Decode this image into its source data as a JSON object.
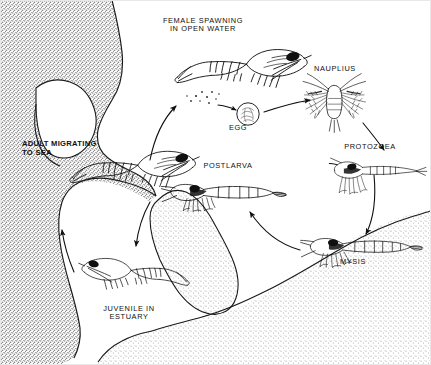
{
  "figure": {
    "labels": {
      "female_spawning": "FEMALE SPAWNING\nIN OPEN WATER",
      "nauplius": "NAUPLIUS",
      "protozoea": "PROTOZOEA",
      "mysis": "MYSIS",
      "postlarva": "POSTLARVA",
      "egg": "EGG",
      "adult_migrating": "ADULT MIGRATING\nTO SEA",
      "juvenile": "JUVENILE IN\nESTUARY"
    },
    "stages": [
      {
        "id": "female-spawning",
        "label": "FEMALE SPAWNING IN OPEN WATER",
        "kind": "adult-shrimp"
      },
      {
        "id": "egg",
        "label": "EGG",
        "kind": "egg"
      },
      {
        "id": "nauplius",
        "label": "NAUPLIUS",
        "kind": "nauplius-larva"
      },
      {
        "id": "protozoea",
        "label": "PROTOZOEA",
        "kind": "protozoea-larva"
      },
      {
        "id": "mysis",
        "label": "MYSIS",
        "kind": "mysis-larva"
      },
      {
        "id": "postlarva",
        "label": "POSTLARVA",
        "kind": "postlarva-shrimp"
      },
      {
        "id": "juvenile",
        "label": "JUVENILE IN ESTUARY",
        "kind": "juvenile-shrimp"
      },
      {
        "id": "adult-migrating",
        "label": "ADULT MIGRATING TO SEA",
        "kind": "adult-shrimp"
      }
    ],
    "flow": [
      {
        "from": "female-spawning",
        "to": "egg"
      },
      {
        "from": "egg",
        "to": "nauplius"
      },
      {
        "from": "nauplius",
        "to": "protozoea"
      },
      {
        "from": "protozoea",
        "to": "mysis"
      },
      {
        "from": "mysis",
        "to": "postlarva"
      },
      {
        "from": "postlarva",
        "to": "juvenile"
      },
      {
        "from": "juvenile",
        "to": "adult-migrating"
      },
      {
        "from": "adult-migrating",
        "to": "female-spawning"
      }
    ],
    "colors": {
      "ink": "#101010",
      "land_dark": "#a8a8a8",
      "land_light": "#d2d2d2",
      "water": "#ffffff"
    }
  }
}
